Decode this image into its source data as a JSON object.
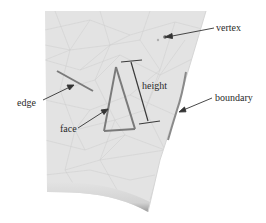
{
  "diagram": {
    "colors": {
      "mesh_fill": "#e3e3e3",
      "mesh_lines": "#c9c9c9",
      "highlight": "#7a7a7a",
      "arrow": "#333333",
      "text": "#2a2a2a",
      "background": "#ffffff"
    },
    "labels": {
      "vertex": "vertex",
      "edge": "edge",
      "height": "height",
      "face": "face",
      "boundary": "boundary"
    }
  }
}
